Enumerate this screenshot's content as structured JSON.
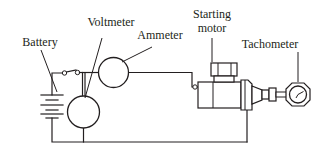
{
  "diagram": {
    "background_color": "#ffffff",
    "line_color": "#231f20",
    "labels": {
      "battery": "Battery",
      "voltmeter": "Voltmeter",
      "ammeter": "Ammeter",
      "starting_motor_line1": "Starting",
      "starting_motor_line2": "motor",
      "tachometer": "Tachometer"
    },
    "components": [
      {
        "id": "battery",
        "name": "battery",
        "label": "Battery",
        "symbol": "battery-cells"
      },
      {
        "id": "switch",
        "name": "switch",
        "label": "",
        "symbol": "open-switch"
      },
      {
        "id": "voltmeter",
        "name": "voltmeter",
        "label": "Voltmeter",
        "symbol": "circle-meter"
      },
      {
        "id": "ammeter",
        "name": "ammeter",
        "label": "Ammeter",
        "symbol": "circle-meter"
      },
      {
        "id": "starting-motor",
        "name": "starting-motor",
        "label": "Starting motor",
        "symbol": "starter-motor-body"
      },
      {
        "id": "tachometer",
        "name": "tachometer",
        "label": "Tachometer",
        "symbol": "dial-gauge"
      }
    ]
  }
}
